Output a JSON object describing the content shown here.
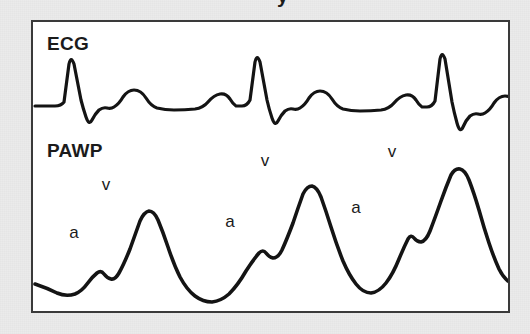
{
  "figure": {
    "background_color": "#ebebeb",
    "panel_color": "#ffffff",
    "frame_color": "#3a3a3a",
    "trace_color": "#141414",
    "clipped_title_fragment": "y",
    "channels": [
      {
        "id": "ecg",
        "label": "ECG"
      },
      {
        "id": "pawp",
        "label": "PAWP"
      }
    ],
    "annotations": [
      {
        "id": "a1",
        "text": "a",
        "x": 72,
        "y": 236
      },
      {
        "id": "v1",
        "text": "v",
        "x": 104,
        "y": 188
      },
      {
        "id": "a2",
        "text": "a",
        "x": 228,
        "y": 225
      },
      {
        "id": "v2",
        "text": "v",
        "x": 263,
        "y": 164
      },
      {
        "id": "a3",
        "text": "a",
        "x": 354,
        "y": 211
      },
      {
        "id": "v3",
        "text": "v",
        "x": 390,
        "y": 155
      }
    ]
  },
  "chart_data": {
    "type": "line",
    "title": "",
    "subtitle": "",
    "xlabel": "",
    "ylabel": "",
    "grid": false,
    "legend_position": "none",
    "axis_ticks_visible": false,
    "series": [
      {
        "name": "ECG",
        "label": "ECG",
        "color": "#141414",
        "path": "M 2 84 L 22 84 Q 28 84 31 80 L 36 42 Q 38 33 41 42 L 48 78 Q 50 86 53 95 Q 56 104 59 98 Q 62 92 66 88 Q 70 85 74 86 Q 78 87 81 85 Q 86 82 90 75 Q 95 68 101 68 Q 108 68 113 76 Q 118 84 124 86 Q 132 88 141 88 Q 152 88 162 87 Q 170 86 175 80 Q 181 73 187 72 Q 193 71 197 77 Q 200 82 203 84 L 209 84 Q 214 84 217 78 L 222 40 Q 224 31 227 40 L 234 78 Q 236 87 239 96 Q 242 105 245 99 Q 248 93 252 89 Q 256 86 260 87 Q 264 88 267 86 Q 272 83 276 76 Q 281 69 287 69 Q 294 69 299 77 Q 304 85 310 87 Q 318 89 327 89 Q 338 89 348 88 Q 356 87 361 81 Q 367 74 373 73 Q 379 72 383 78 Q 386 83 389 85 L 394 85 Q 399 85 402 79 L 407 37 Q 409 28 412 37 L 419 80 Q 421 90 424 101 Q 427 112 430 105 Q 433 98 437 94 Q 441 91 445 92 Q 449 93 452 91 Q 457 88 461 81 Q 466 74 472 74 Q 479 74 484 82 Q 489 90 495 92 Q 503 94 512 94 L 560 94"
      },
      {
        "name": "PAWP",
        "label": "PAWP",
        "color": "#141414",
        "path": "M 2 262 Q 14 266 24 271 Q 33 275 42 272 Q 49 269 54 262 Q 59 255 64 251 Q 68 248 71 252 Q 74 256 78 257 Q 82 258 86 251 Q 91 242 97 227 Q 102 213 107 199 Q 111 190 116 189 Q 121 189 125 198 Q 130 210 135 225 Q 141 243 147 255 Q 154 268 162 274 Q 170 280 179 280 Q 188 279 196 272 Q 205 263 213 249 Q 220 238 226 231 Q 230 227 233 231 Q 236 235 240 236 Q 245 236 249 228 Q 254 217 260 201 Q 265 186 270 172 Q 274 164 279 164 Q 284 165 288 175 Q 293 189 298 205 Q 304 224 310 239 Q 316 253 323 262 Q 330 271 338 271 Q 346 270 353 261 Q 360 252 366 237 Q 371 225 375 217 Q 378 212 381 216 Q 384 220 388 220 Q 393 219 397 209 Q 402 196 408 179 Q 413 165 418 153 Q 422 146 427 147 Q 432 148 436 158 Q 441 171 446 188 Q 451 206 456 221 Q 461 236 466 247 Q 470 255 475 259 Q 481 263 489 264 L 520 264"
      }
    ],
    "ecg_beats": [
      {
        "beat": 1,
        "r_peak_x": 38,
        "r_peak_y": 33,
        "s_nadir_y": 104
      },
      {
        "beat": 2,
        "r_peak_x": 224,
        "r_peak_y": 31,
        "s_nadir_y": 105
      },
      {
        "beat": 3,
        "r_peak_x": 409,
        "r_peak_y": 28,
        "s_nadir_y": 112
      }
    ],
    "pawp_cycles": [
      {
        "cycle": 1,
        "a_wave_x": 74,
        "a_wave_y": 256,
        "v_wave_x": 117,
        "v_wave_y": 189
      },
      {
        "cycle": 2,
        "a_wave_x": 236,
        "a_wave_y": 235,
        "v_wave_x": 280,
        "v_wave_y": 164
      },
      {
        "cycle": 3,
        "a_wave_x": 384,
        "a_wave_y": 220,
        "v_wave_x": 427,
        "v_wave_y": 147
      }
    ]
  }
}
